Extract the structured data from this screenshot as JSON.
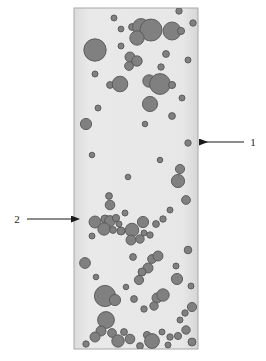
{
  "figure": {
    "type": "micrograph-schematic",
    "background_color": "#ffffff",
    "region": {
      "name": "specimen-region",
      "x": 74,
      "y": 8,
      "width": 124,
      "height": 341,
      "fill_color": "#e6e6e6",
      "border_color": "#a8a8a8",
      "border_width": 1
    },
    "particles": {
      "fill_color": "#808080",
      "stroke_color": "#575757",
      "stroke_width": 0.9,
      "count": 97,
      "radius_range": [
        2.0,
        11.5
      ],
      "items": [
        {
          "cx": 179,
          "cy": 11,
          "r": 3.2
        },
        {
          "cx": 121,
          "cy": 29,
          "r": 2.9
        },
        {
          "cx": 132,
          "cy": 27,
          "r": 3.4
        },
        {
          "cx": 141,
          "cy": 27,
          "r": 8.4
        },
        {
          "cx": 151,
          "cy": 30,
          "r": 11.0
        },
        {
          "cx": 172,
          "cy": 31,
          "r": 9.0
        },
        {
          "cx": 181,
          "cy": 31,
          "r": 3.6
        },
        {
          "cx": 137,
          "cy": 38,
          "r": 7.2
        },
        {
          "cx": 95,
          "cy": 50,
          "r": 11.2
        },
        {
          "cx": 130,
          "cy": 57,
          "r": 5.0
        },
        {
          "cx": 137,
          "cy": 61,
          "r": 5.2
        },
        {
          "cx": 129,
          "cy": 66,
          "r": 4.4
        },
        {
          "cx": 110,
          "cy": 85,
          "r": 3.4
        },
        {
          "cx": 120,
          "cy": 84,
          "r": 7.8
        },
        {
          "cx": 149,
          "cy": 81,
          "r": 6.2
        },
        {
          "cx": 160,
          "cy": 84,
          "r": 10.4
        },
        {
          "cx": 172,
          "cy": 85,
          "r": 3.6
        },
        {
          "cx": 150,
          "cy": 104,
          "r": 7.6
        },
        {
          "cx": 172,
          "cy": 116,
          "r": 3.4
        },
        {
          "cx": 86,
          "cy": 124,
          "r": 5.6
        },
        {
          "cx": 188,
          "cy": 143,
          "r": 3.2
        },
        {
          "cx": 180,
          "cy": 169,
          "r": 4.6
        },
        {
          "cx": 178,
          "cy": 181,
          "r": 6.6
        },
        {
          "cx": 109,
          "cy": 196,
          "r": 3.4
        },
        {
          "cx": 110,
          "cy": 205,
          "r": 4.8
        },
        {
          "cx": 186,
          "cy": 200,
          "r": 4.4
        },
        {
          "cx": 95,
          "cy": 222,
          "r": 6.0
        },
        {
          "cx": 105,
          "cy": 219,
          "r": 4.0
        },
        {
          "cx": 110,
          "cy": 221,
          "r": 5.4
        },
        {
          "cx": 116,
          "cy": 218,
          "r": 3.6
        },
        {
          "cx": 104,
          "cy": 229,
          "r": 6.2
        },
        {
          "cx": 113,
          "cy": 230,
          "r": 3.4
        },
        {
          "cx": 119,
          "cy": 224,
          "r": 3.0
        },
        {
          "cx": 121,
          "cy": 231,
          "r": 4.0
        },
        {
          "cx": 132,
          "cy": 230,
          "r": 6.8
        },
        {
          "cx": 143,
          "cy": 222,
          "r": 5.6
        },
        {
          "cx": 156,
          "cy": 224,
          "r": 3.4
        },
        {
          "cx": 150,
          "cy": 235,
          "r": 3.2
        },
        {
          "cx": 131,
          "cy": 240,
          "r": 5.0
        },
        {
          "cx": 140,
          "cy": 239,
          "r": 4.2
        },
        {
          "cx": 144,
          "cy": 233,
          "r": 3.0
        },
        {
          "cx": 188,
          "cy": 250,
          "r": 3.8
        },
        {
          "cx": 85,
          "cy": 263,
          "r": 5.4
        },
        {
          "cx": 152,
          "cy": 259,
          "r": 4.4
        },
        {
          "cx": 158,
          "cy": 256,
          "r": 5.0
        },
        {
          "cx": 148,
          "cy": 268,
          "r": 5.0
        },
        {
          "cx": 177,
          "cy": 279,
          "r": 5.6
        },
        {
          "cx": 142,
          "cy": 272,
          "r": 4.0
        },
        {
          "cx": 139,
          "cy": 280,
          "r": 4.6
        },
        {
          "cx": 105,
          "cy": 296,
          "r": 10.6
        },
        {
          "cx": 115,
          "cy": 300,
          "r": 5.6
        },
        {
          "cx": 134,
          "cy": 299,
          "r": 3.4
        },
        {
          "cx": 157,
          "cy": 298,
          "r": 5.0
        },
        {
          "cx": 163,
          "cy": 295,
          "r": 6.2
        },
        {
          "cx": 154,
          "cy": 306,
          "r": 4.2
        },
        {
          "cx": 192,
          "cy": 307,
          "r": 4.6
        },
        {
          "cx": 185,
          "cy": 313,
          "r": 3.2
        },
        {
          "cx": 106,
          "cy": 320,
          "r": 8.4
        },
        {
          "cx": 101,
          "cy": 331,
          "r": 5.0
        },
        {
          "cx": 112,
          "cy": 333,
          "r": 4.4
        },
        {
          "cx": 124,
          "cy": 332,
          "r": 3.4
        },
        {
          "cx": 95,
          "cy": 337,
          "r": 5.0
        },
        {
          "cx": 118,
          "cy": 341,
          "r": 6.2
        },
        {
          "cx": 130,
          "cy": 339,
          "r": 4.8
        },
        {
          "cx": 147,
          "cy": 335,
          "r": 3.6
        },
        {
          "cx": 152,
          "cy": 341,
          "r": 7.4
        },
        {
          "cx": 162,
          "cy": 332,
          "r": 3.0
        },
        {
          "cx": 170,
          "cy": 337,
          "r": 3.2
        },
        {
          "cx": 178,
          "cy": 336,
          "r": 3.6
        },
        {
          "cx": 186,
          "cy": 330,
          "r": 4.2
        },
        {
          "cx": 192,
          "cy": 342,
          "r": 4.0
        },
        {
          "cx": 168,
          "cy": 345,
          "r": 3.0
        },
        {
          "cx": 140,
          "cy": 346,
          "r": 3.4
        },
        {
          "cx": 86,
          "cy": 344,
          "r": 3.2
        },
        {
          "cx": 180,
          "cy": 320,
          "r": 3.0
        },
        {
          "cx": 144,
          "cy": 309,
          "r": 3.2
        },
        {
          "cx": 176,
          "cy": 266,
          "r": 3.0
        },
        {
          "cx": 133,
          "cy": 257,
          "r": 3.4
        },
        {
          "cx": 125,
          "cy": 213,
          "r": 3.0
        },
        {
          "cx": 163,
          "cy": 219,
          "r": 3.2
        },
        {
          "cx": 92,
          "cy": 236,
          "r": 3.0
        },
        {
          "cx": 166,
          "cy": 54,
          "r": 3.4
        },
        {
          "cx": 114,
          "cy": 18,
          "r": 3.0
        },
        {
          "cx": 193,
          "cy": 23,
          "r": 3.2
        },
        {
          "cx": 95,
          "cy": 74,
          "r": 3.0
        },
        {
          "cx": 161,
          "cy": 67,
          "r": 3.2
        },
        {
          "cx": 121,
          "cy": 46,
          "r": 3.0
        },
        {
          "cx": 188,
          "cy": 60,
          "r": 3.0
        },
        {
          "cx": 98,
          "cy": 108,
          "r": 3.0
        },
        {
          "cx": 182,
          "cy": 98,
          "r": 3.0
        },
        {
          "cx": 145,
          "cy": 124,
          "r": 2.8
        },
        {
          "cx": 92,
          "cy": 155,
          "r": 2.8
        },
        {
          "cx": 160,
          "cy": 160,
          "r": 2.8
        },
        {
          "cx": 128,
          "cy": 177,
          "r": 2.8
        },
        {
          "cx": 170,
          "cy": 210,
          "r": 3.0
        },
        {
          "cx": 96,
          "cy": 277,
          "r": 2.8
        },
        {
          "cx": 126,
          "cy": 287,
          "r": 2.8
        },
        {
          "cx": 191,
          "cy": 286,
          "r": 3.0
        }
      ]
    },
    "annotations": [
      {
        "name": "annotation-1",
        "label": "1",
        "label_x": 253,
        "label_y": 146,
        "arrow": {
          "from_x": 244,
          "from_y": 142,
          "to_x": 200,
          "to_y": 142,
          "direction": "left",
          "color": "#1a1a1a"
        }
      },
      {
        "name": "annotation-2",
        "label": "2",
        "label_x": 17,
        "label_y": 223,
        "arrow": {
          "from_x": 27,
          "from_y": 219,
          "to_x": 72,
          "to_y": 219,
          "direction": "right",
          "color": "#1a1a1a"
        }
      }
    ],
    "colors": {
      "particle_fill": "#808080",
      "particle_stroke": "#575757",
      "region_fill": "#e6e6e6",
      "region_border": "#a8a8a8",
      "annotation": "#1a1a1a",
      "page_background": "#ffffff"
    }
  }
}
